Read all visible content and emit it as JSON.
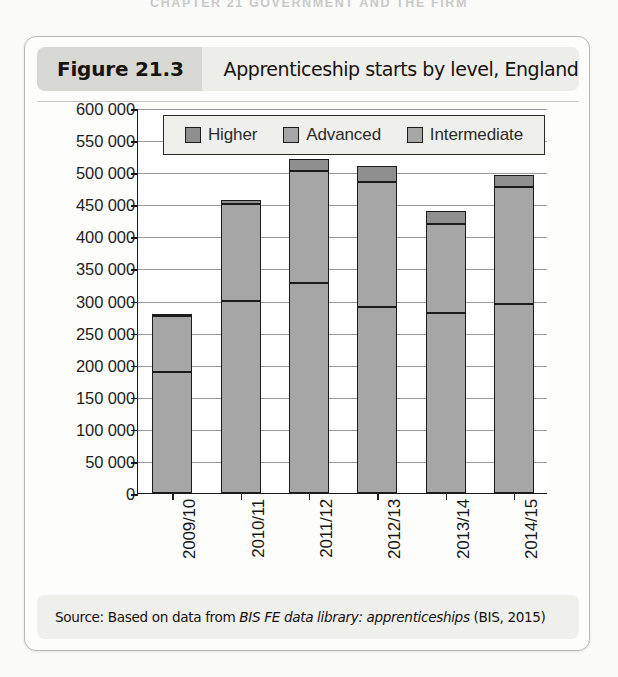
{
  "running_head": "CHAPTER 21  GOVERNMENT AND THE FIRM",
  "figure": {
    "number_label": "Figure 21.3",
    "caption": "Apprenticeship starts by level, England",
    "source_prefix": "Source: Based on data from ",
    "source_italic": "BIS FE data library: apprenticeships",
    "source_suffix": " (BIS, 2015)"
  },
  "chart_data": {
    "type": "bar",
    "title": "Apprenticeship starts by level, England",
    "xlabel": "",
    "ylabel": "",
    "stacked": true,
    "grid": true,
    "legend_position": "top-inside",
    "ylim": [
      0,
      600000
    ],
    "ytick_step": 50000,
    "ytick_labels": [
      "600 000",
      "550 000",
      "500 000",
      "450 000",
      "400 000",
      "350 000",
      "300 000",
      "250 000",
      "200 000",
      "150 000",
      "100 000",
      "50 000",
      "0"
    ],
    "ytick_values": [
      600000,
      550000,
      500000,
      450000,
      400000,
      350000,
      300000,
      250000,
      200000,
      150000,
      100000,
      50000,
      0
    ],
    "categories": [
      "2009/10",
      "2010/11",
      "2011/12",
      "2012/13",
      "2013/14",
      "2014/15"
    ],
    "series": [
      {
        "name": "Intermediate",
        "color": "#a6a6a6",
        "values": [
          189000,
          300000,
          327000,
          290000,
          280000,
          294000
        ]
      },
      {
        "name": "Advanced",
        "color": "#a6a6a6",
        "values": [
          87000,
          150000,
          175000,
          195000,
          140000,
          183000
        ]
      },
      {
        "name": "Higher",
        "color": "#8f8f8f",
        "values": [
          3000,
          7000,
          19000,
          25000,
          20000,
          18000
        ]
      }
    ],
    "totals": [
      279000,
      457000,
      521000,
      510000,
      440000,
      495000
    ],
    "legend_entries": [
      "Higher",
      "Advanced",
      "Intermediate"
    ]
  }
}
